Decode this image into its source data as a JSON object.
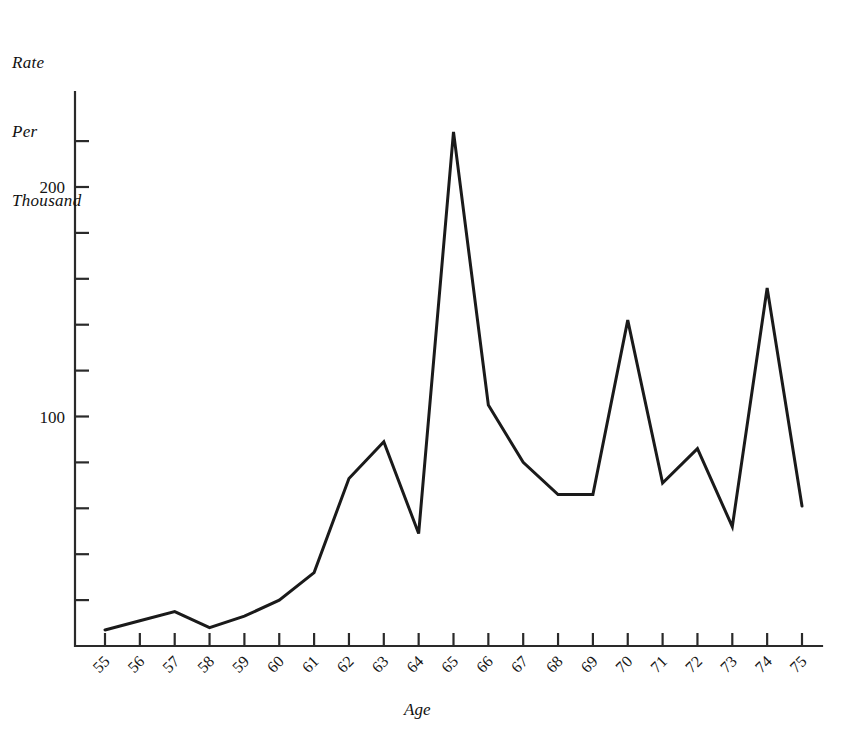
{
  "figure": {
    "background_color": "#ffffff",
    "line_color": "#1a1a1a",
    "axis_color": "#2a2a2a"
  },
  "axes": {
    "y_axis_title_lines": [
      "Rate",
      "Per",
      "Thousand"
    ],
    "x_axis_title": "Age",
    "y_tick_labels": [
      "100",
      "200"
    ],
    "y_tick_values": [
      100,
      200
    ],
    "y_minor_tick_values": [
      20,
      40,
      60,
      80,
      120,
      140,
      160,
      180,
      220
    ],
    "y_limits": [
      0,
      230
    ],
    "x_tick_labels": [
      "55",
      "56",
      "57",
      "58",
      "59",
      "60",
      "61",
      "62",
      "63",
      "64",
      "65",
      "66",
      "67",
      "68",
      "69",
      "70",
      "71",
      "72",
      "73",
      "74",
      "75"
    ],
    "x_limits": [
      55,
      75
    ]
  },
  "chart_data": {
    "type": "line",
    "title": "",
    "subtitle": "",
    "xlabel": "Age",
    "ylabel": "Rate Per Thousand",
    "xlim": [
      55,
      75
    ],
    "ylim": [
      0,
      230
    ],
    "grid": false,
    "legend": null,
    "x": [
      55,
      56,
      57,
      58,
      59,
      60,
      61,
      62,
      63,
      64,
      65,
      66,
      67,
      68,
      69,
      70,
      71,
      72,
      73,
      74,
      75
    ],
    "categories": [
      "55",
      "56",
      "57",
      "58",
      "59",
      "60",
      "61",
      "62",
      "63",
      "64",
      "65",
      "66",
      "67",
      "68",
      "69",
      "70",
      "71",
      "72",
      "73",
      "74",
      "75"
    ],
    "values": [
      7,
      11,
      15,
      8,
      13,
      20,
      32,
      73,
      89,
      49,
      224,
      105,
      80,
      66,
      66,
      142,
      71,
      86,
      52,
      156,
      61
    ],
    "series": [
      {
        "name": "Rate Per Thousand",
        "values": [
          7,
          11,
          15,
          8,
          13,
          20,
          32,
          73,
          89,
          49,
          224,
          105,
          80,
          66,
          66,
          142,
          71,
          86,
          52,
          156,
          61
        ]
      }
    ],
    "annotations": []
  }
}
